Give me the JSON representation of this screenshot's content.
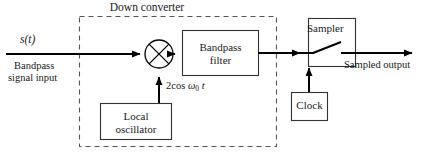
{
  "figure": {
    "type": "block-diagram"
  },
  "groups": {
    "down_converter": {
      "label": "Down converter",
      "style": "dashed-rectangle"
    }
  },
  "inputs": {
    "signal_symbol": "s(t)",
    "signal_caption_line1": "Bandpass",
    "signal_caption_line2": "signal input"
  },
  "blocks": {
    "mixer": {
      "icon": "mixer-multiplier-circle-x"
    },
    "local_oscillator": {
      "label_line1": "Local",
      "label_line2": "oscillator"
    },
    "bandpass_filter": {
      "label_line1": "Bandpass",
      "label_line2": "filter"
    },
    "sampler": {
      "label": "Sampler",
      "icon": "switch-contact"
    },
    "clock": {
      "label": "Clock"
    }
  },
  "annotations": {
    "lo_drive_prefix": "2cos ",
    "lo_drive_omega": "ω",
    "lo_drive_subscript": "0",
    "lo_drive_time": "t",
    "output_label": "Sampled output"
  },
  "colors": {
    "ink": "#1a1a1a",
    "line": "#000000",
    "box_stroke": "#333333",
    "dashed_stroke": "#555555",
    "background": "#ffffff"
  }
}
